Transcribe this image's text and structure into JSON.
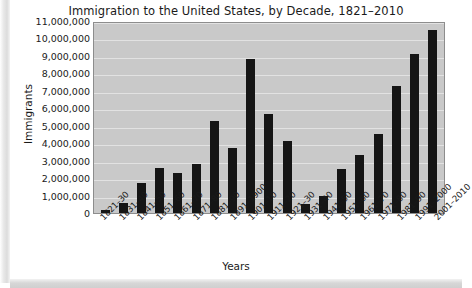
{
  "chart_data": {
    "type": "bar",
    "title": "Immigration to the United States, by Decade, 1821–2010",
    "xlabel": "Years",
    "ylabel": "Immigrants",
    "ylim": [
      0,
      11000000
    ],
    "ytick_step": 1000000,
    "grid": true,
    "legend": null,
    "categories": [
      "1821–30",
      "1831–40",
      "1841–50",
      "1851–60",
      "1861–70",
      "1871–80",
      "1881–90",
      "1891–1900",
      "1901–10",
      "1911–20",
      "1921–30",
      "1931–40",
      "1941–50",
      "1951–60",
      "1961–70",
      "1971–80",
      "1981–90",
      "1991–2000",
      "2001–2010"
    ],
    "values": [
      150000,
      600000,
      1700000,
      2600000,
      2300000,
      2800000,
      5250000,
      3700000,
      8800000,
      5700000,
      4100000,
      530000,
      1000000,
      2500000,
      3300000,
      4500000,
      7300000,
      9100000,
      10500000
    ],
    "ytick_labels": [
      "11,000,000",
      "10,000,000",
      "9,000,000",
      "8,000,000",
      "7,000,000",
      "6,000,000",
      "5,000,000",
      "4,000,000",
      "3,000,000",
      "2,000,000",
      "1,000,000",
      "0"
    ],
    "colors": {
      "bar": "#151515",
      "plot_background": "#c9c9c9",
      "gridline": "#e2e2e2",
      "axis_border": "#8d8d8d",
      "text": "#1a1a1a",
      "figure_background": "#ffffff"
    }
  }
}
